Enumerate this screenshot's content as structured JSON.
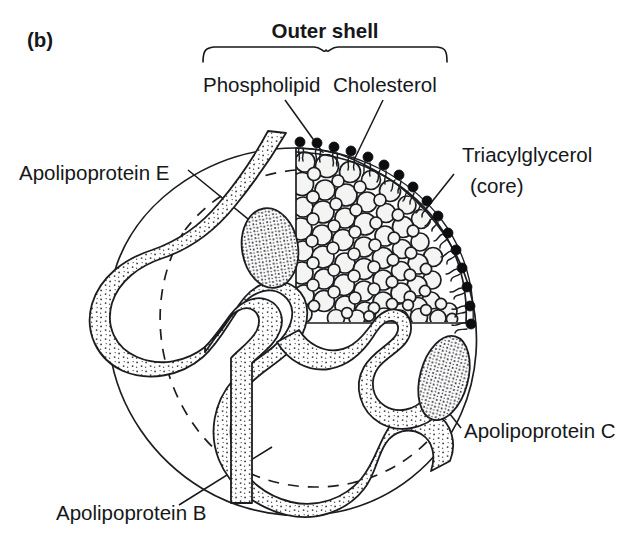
{
  "figure": {
    "panel_tag": "(b)",
    "kind": "lipoprotein-particle-cutaway-diagram"
  },
  "labels": {
    "outer_shell": "Outer shell",
    "phospholipid": "Phospholipid",
    "cholesterol": "Cholesterol",
    "triacylglycerol": "Triacylglycerol",
    "triacylglycerol_sub": "(core)",
    "apolipoprotein_e": "Apolipoprotein E",
    "apolipoprotein_c": "Apolipoprotein C",
    "apolipoprotein_b": "Apolipoprotein B"
  },
  "colors": {
    "ink": "#1b1d20",
    "text": "#15171a",
    "background": "#ffffff",
    "core_droplet_fill": "#f4f4f2",
    "lipid_head": "#0c0d0f",
    "stipple": "#3a3c40"
  },
  "parts": {
    "sphere": "particle-outline",
    "cut_quadrant": "upper-right-cutaway",
    "core": "triacylglycerol-droplets",
    "shell": "phospholipid-cholesterol-monolayer",
    "apo_b": "serpentine-stippled-ribbon",
    "apo_e": "stippled-oval-upper-left",
    "apo_c": "stippled-oval-lower-right",
    "hidden_edges": "dashed-back-hemisphere"
  }
}
